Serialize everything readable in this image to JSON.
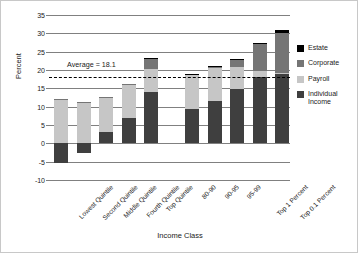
{
  "chart_data": {
    "type": "bar",
    "title": "",
    "subtitle": "",
    "xlabel": "Income Class",
    "ylabel": "Percent",
    "ylim": [
      -10,
      35
    ],
    "ytick_values": [
      35,
      30,
      25,
      20,
      15,
      10,
      5,
      0,
      -5,
      -10
    ],
    "ytick_labels": [
      "35",
      "30",
      "25",
      "20",
      "15",
      "10",
      "5",
      "0",
      "-5",
      "-10"
    ],
    "grid": true,
    "stacked": true,
    "legend_position": "right",
    "categories": [
      "Lowest Quintile",
      "Second Quintile",
      "Middle Quintile",
      "Fourth Quintile",
      "Top Quintile",
      "80-90",
      "90-95",
      "95-99",
      "Top 1 Percent",
      "Top 0.1 Percent"
    ],
    "group_break_after_index": 4,
    "series": [
      {
        "name": "Individual Income",
        "color": "#3f3f3f",
        "values": [
          -5.4,
          -2.7,
          3.2,
          7.0,
          13.9,
          9.4,
          11.6,
          14.9,
          18.2,
          18.8
        ]
      },
      {
        "name": "Payroll",
        "color": "#c6c6c6",
        "values": [
          12.0,
          11.3,
          9.3,
          9.1,
          6.4,
          9.2,
          8.9,
          6.0,
          1.6,
          0.4
        ]
      },
      {
        "name": "Corporate",
        "color": "#757575",
        "values": [
          0.1,
          0.1,
          0.1,
          0.2,
          2.6,
          0.3,
          0.5,
          1.7,
          7.2,
          10.9
        ]
      },
      {
        "name": "Estate",
        "color": "#000000",
        "values": [
          0.0,
          0.0,
          0.0,
          0.0,
          0.3,
          0.1,
          0.1,
          0.4,
          0.5,
          0.7
        ]
      }
    ],
    "totals": [
      6.7,
      8.7,
      12.6,
      16.3,
      23.2,
      19.0,
      21.1,
      23.0,
      27.5,
      30.8
    ],
    "annotations": [
      {
        "name": "average-line",
        "label": "Average = 18.1",
        "value": 18.1,
        "style": "dashed-horizontal",
        "color": "#000000"
      }
    ]
  },
  "legend": {
    "items": [
      {
        "label": "Estate",
        "color": "#000000"
      },
      {
        "label": "Corporate",
        "color": "#757575"
      },
      {
        "label": "Payroll",
        "color": "#c6c6c6"
      },
      {
        "label": "Individual\nIncome",
        "color": "#3f3f3f"
      }
    ]
  }
}
